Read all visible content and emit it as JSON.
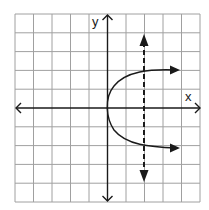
{
  "graph": {
    "x_label": "x",
    "y_label": "y",
    "grid": {
      "cols": 10,
      "rows": 10,
      "line_color": "#9a9a9a"
    },
    "axes_color": "#1a1a1a",
    "curve": {
      "type": "sideways-parabola",
      "vertex": [
        0,
        0
      ],
      "opens": "right",
      "points": [
        [
          0,
          0
        ],
        [
          2,
          2
        ],
        [
          2,
          -2
        ],
        [
          4,
          2
        ],
        [
          4,
          -2
        ]
      ]
    },
    "dashed_line": {
      "type": "vertical-line-test",
      "x": 2
    }
  }
}
